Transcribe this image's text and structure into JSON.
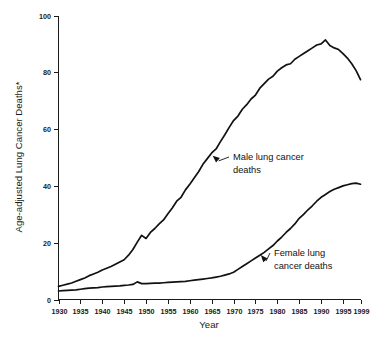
{
  "chart_data": {
    "type": "line",
    "title": "",
    "xlabel": "Year",
    "ylabel": "Age-adjusted Lung Cancer Deaths*",
    "xlim": [
      1930,
      1999
    ],
    "ylim": [
      0,
      100
    ],
    "grid": false,
    "legend_position": "inline-annotations",
    "xticks": [
      "1930",
      "1935",
      "1940",
      "1945",
      "1950",
      "1955",
      "1960",
      "1965",
      "1970",
      "1975",
      "1980",
      "1985",
      "1990",
      "1995",
      "1999"
    ],
    "xtick_values": [
      1930,
      1935,
      1940,
      1945,
      1950,
      1955,
      1960,
      1965,
      1970,
      1975,
      1980,
      1985,
      1990,
      1995,
      1999
    ],
    "yticks": [
      "0",
      "20",
      "40",
      "60",
      "80",
      "100"
    ],
    "ytick_values": [
      0,
      20,
      40,
      60,
      80,
      100
    ],
    "x": [
      1930,
      1931,
      1932,
      1933,
      1934,
      1935,
      1936,
      1937,
      1938,
      1939,
      1940,
      1941,
      1942,
      1943,
      1944,
      1945,
      1946,
      1947,
      1948,
      1949,
      1950,
      1951,
      1952,
      1953,
      1954,
      1955,
      1956,
      1957,
      1958,
      1959,
      1960,
      1961,
      1962,
      1963,
      1964,
      1965,
      1966,
      1967,
      1968,
      1969,
      1970,
      1971,
      1972,
      1973,
      1974,
      1975,
      1976,
      1977,
      1978,
      1979,
      1980,
      1981,
      1982,
      1983,
      1984,
      1985,
      1986,
      1987,
      1988,
      1989,
      1990,
      1991,
      1992,
      1993,
      1994,
      1995,
      1996,
      1997,
      1998,
      1999
    ],
    "series": [
      {
        "name": "Male lung cancer deaths",
        "values": [
          4.6,
          5.0,
          5.4,
          5.8,
          6.4,
          7.0,
          7.6,
          8.4,
          9.0,
          9.6,
          10.4,
          11.0,
          11.6,
          12.4,
          13.2,
          14.0,
          15.6,
          17.6,
          20.2,
          22.6,
          21.5,
          23.6,
          25.0,
          26.6,
          28.0,
          30.2,
          32.2,
          34.6,
          36.0,
          38.6,
          40.6,
          42.8,
          45.0,
          47.6,
          49.6,
          51.6,
          53.0,
          55.6,
          58.0,
          60.6,
          63.0,
          64.6,
          67.0,
          68.6,
          70.6,
          72.0,
          74.4,
          76.0,
          77.6,
          78.6,
          80.4,
          81.6,
          82.6,
          83.0,
          84.6,
          85.6,
          86.6,
          87.6,
          88.6,
          89.6,
          90.0,
          91.4,
          89.4,
          88.6,
          88.0,
          86.6,
          85.0,
          83.0,
          80.6,
          77.4
        ]
      },
      {
        "name": "Female lung cancer deaths",
        "values": [
          3.0,
          3.1,
          3.2,
          3.3,
          3.4,
          3.6,
          3.8,
          4.0,
          4.1,
          4.2,
          4.4,
          4.5,
          4.6,
          4.7,
          4.8,
          5.0,
          5.1,
          5.3,
          6.2,
          5.6,
          5.6,
          5.7,
          5.8,
          5.8,
          5.9,
          6.0,
          6.1,
          6.2,
          6.3,
          6.4,
          6.6,
          6.8,
          7.0,
          7.2,
          7.4,
          7.6,
          7.9,
          8.2,
          8.6,
          9.0,
          9.6,
          10.6,
          11.6,
          12.6,
          13.6,
          14.6,
          15.6,
          16.6,
          17.8,
          19.0,
          20.6,
          22.0,
          23.6,
          25.0,
          26.6,
          28.6,
          30.0,
          31.6,
          33.0,
          34.6,
          36.0,
          37.0,
          38.0,
          38.8,
          39.4,
          40.0,
          40.4,
          40.8,
          41.0,
          40.6
        ]
      }
    ],
    "annotations": [
      {
        "id": "male-annotation",
        "lines": [
          "Male lung cancer",
          "deaths"
        ],
        "target_year": 1965,
        "target_value": 51
      },
      {
        "id": "female-annotation",
        "lines": [
          "Female lung",
          "cancer deaths"
        ],
        "target_year": 1976,
        "target_value": 16
      }
    ],
    "footnote": ""
  }
}
